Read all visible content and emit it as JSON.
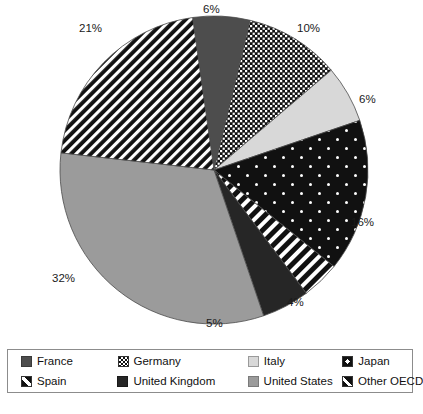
{
  "chart_data": {
    "type": "pie",
    "title": "",
    "subtitle": "",
    "xlabel": "",
    "ylabel": "",
    "grid": false,
    "legend_position": "bottom",
    "start_angle_deg": -8,
    "direction": "clockwise",
    "categories": [
      "France",
      "Germany",
      "Italy",
      "Japan",
      "Spain",
      "United Kingdom",
      "United States",
      "Other OECD"
    ],
    "values": [
      6,
      10,
      6,
      16,
      4,
      5,
      32,
      21
    ],
    "data_labels": [
      "6%",
      "10%",
      "6%",
      "16%",
      "4%",
      "5%",
      "32%",
      "21%"
    ],
    "units": "percent",
    "slices": [
      {
        "name": "France",
        "value": 6,
        "label": "6%",
        "pattern": "solid-dark-gray",
        "color": "#4d4d4d",
        "label_x": 203,
        "label_y": 3
      },
      {
        "name": "Germany",
        "value": 10,
        "label": "10%",
        "pattern": "checkered-dots",
        "color": "#111111",
        "label_x": 297,
        "label_y": 22
      },
      {
        "name": "Italy",
        "value": 6,
        "label": "6%",
        "pattern": "solid-light-gray",
        "color": "#d8d8d8",
        "label_x": 359,
        "label_y": 93
      },
      {
        "name": "Japan",
        "value": 16,
        "label": "16%",
        "pattern": "black-with-white-dots",
        "color": "#111111",
        "label_x": 351,
        "label_y": 216
      },
      {
        "name": "Spain",
        "value": 4,
        "label": "4%",
        "pattern": "diagonal-stripes",
        "color": "#111111",
        "label_x": 287,
        "label_y": 296
      },
      {
        "name": "United Kingdom",
        "value": 5,
        "label": "5%",
        "pattern": "solid-near-black",
        "color": "#262626",
        "label_x": 206,
        "label_y": 317
      },
      {
        "name": "United States",
        "value": 32,
        "label": "32%",
        "pattern": "solid-medium-gray",
        "color": "#9b9b9b",
        "label_x": 52,
        "label_y": 272
      },
      {
        "name": "Other OECD",
        "value": 21,
        "label": "21%",
        "pattern": "dense-diagonal-stripes",
        "color": "#111111",
        "label_x": 79,
        "label_y": 22
      }
    ]
  },
  "legend": {
    "rows": [
      [
        {
          "label": "France",
          "swatch": "sw-france",
          "icon": "legend-swatch-france"
        },
        {
          "label": "Germany",
          "swatch": "sw-germany",
          "icon": "legend-swatch-germany"
        },
        {
          "label": "Italy",
          "swatch": "sw-italy",
          "icon": "legend-swatch-italy"
        },
        {
          "label": "Japan",
          "swatch": "sw-japan",
          "icon": "legend-swatch-japan"
        }
      ],
      [
        {
          "label": "Spain",
          "swatch": "sw-spain",
          "icon": "legend-swatch-spain"
        },
        {
          "label": "United Kingdom",
          "swatch": "sw-uk",
          "icon": "legend-swatch-united-kingdom"
        },
        {
          "label": "United States",
          "swatch": "sw-us",
          "icon": "legend-swatch-united-states"
        },
        {
          "label": "Other OECD",
          "swatch": "sw-oecd",
          "icon": "legend-swatch-other-oecd"
        }
      ]
    ]
  },
  "caption": {
    "text": ""
  }
}
